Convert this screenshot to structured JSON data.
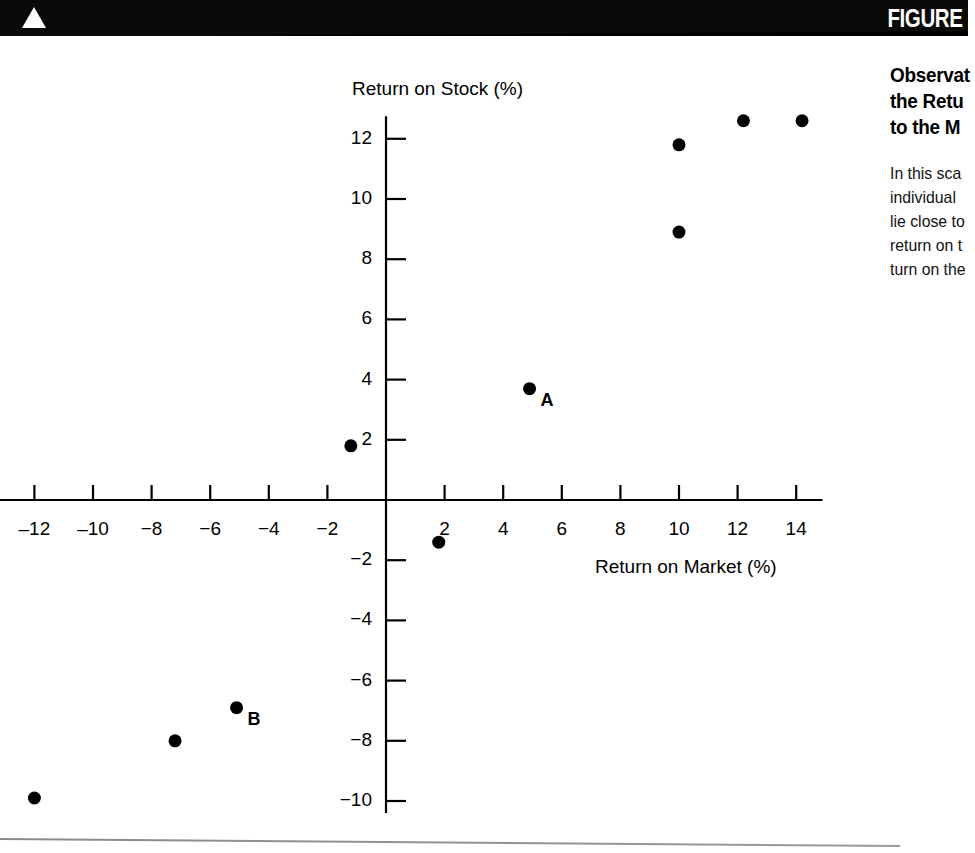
{
  "banner": {
    "figure_label": "FIGURE",
    "triangle_icon": "triangle-up-icon"
  },
  "caption": {
    "title_lines": [
      "Observat",
      "the Retu",
      "to the M"
    ],
    "body_lines": [
      "In this sca",
      "individual",
      "lie close to",
      "return on t",
      "turn on the"
    ]
  },
  "chart_data": {
    "type": "scatter",
    "title": "",
    "xlabel": "Return on Market (%)",
    "ylabel": "Return on Stock (%)",
    "xlim": [
      -13.5,
      15.5
    ],
    "ylim": [
      -10.8,
      13.2
    ],
    "grid": false,
    "legend": "none",
    "xticks": [
      -12,
      -10,
      -8,
      -6,
      -4,
      -2,
      2,
      4,
      6,
      8,
      10,
      12,
      14
    ],
    "xtick_labels": [
      "‒12",
      "‒10",
      "−8",
      "−6",
      "−4",
      "−2",
      "2",
      "4",
      "6",
      "8",
      "10",
      "12",
      "14"
    ],
    "yticks": [
      12,
      10,
      8,
      6,
      4,
      2,
      -2,
      -4,
      -6,
      -8,
      -10
    ],
    "ytick_labels": [
      "12",
      "10",
      "8",
      "6",
      "4",
      "2",
      "−2",
      "−4",
      "−6",
      "−8",
      "−10"
    ],
    "points": [
      {
        "x": 10.0,
        "y": 11.8,
        "label": ""
      },
      {
        "x": 12.2,
        "y": 12.6,
        "label": ""
      },
      {
        "x": 14.2,
        "y": 12.6,
        "label": ""
      },
      {
        "x": 10.0,
        "y": 8.9,
        "label": ""
      },
      {
        "x": 4.9,
        "y": 3.7,
        "label": "A"
      },
      {
        "x": -1.2,
        "y": 1.8,
        "label": ""
      },
      {
        "x": 1.8,
        "y": -1.4,
        "label": ""
      },
      {
        "x": -5.1,
        "y": -6.9,
        "label": "B"
      },
      {
        "x": -7.2,
        "y": -8.0,
        "label": ""
      },
      {
        "x": -12.0,
        "y": -9.9,
        "label": ""
      }
    ],
    "marker_color": "#000000",
    "axis_color": "#000000"
  }
}
